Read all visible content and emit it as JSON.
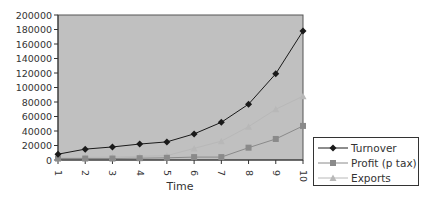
{
  "chart_data": {
    "type": "line",
    "title": "",
    "xlabel": "Time",
    "ylabel": "",
    "x": [
      1,
      2,
      3,
      4,
      5,
      6,
      7,
      8,
      9,
      10
    ],
    "ylim": [
      0,
      200000
    ],
    "yticks": [
      0,
      20000,
      40000,
      60000,
      80000,
      100000,
      120000,
      140000,
      160000,
      180000,
      200000
    ],
    "grid": false,
    "plot_background": "#c0c0c0",
    "legend_position": "right-bottom",
    "series": [
      {
        "name": "Turnover",
        "marker": "diamond",
        "color": "#1a1a1a",
        "values": [
          8000,
          15000,
          18000,
          22000,
          25000,
          36000,
          52000,
          77000,
          119000,
          178000
        ]
      },
      {
        "name": "Profit (p tax)",
        "marker": "square",
        "color": "#8a8a8a",
        "values": [
          2000,
          2000,
          2000,
          2500,
          3000,
          4000,
          4000,
          17000,
          29000,
          47000
        ]
      },
      {
        "name": "Exports",
        "marker": "triangle",
        "color": "#b8b8b8",
        "values": [
          3000,
          3500,
          4000,
          5000,
          6000,
          16000,
          26000,
          46000,
          70000,
          88000
        ]
      }
    ]
  },
  "labels": {
    "xlabel": "Time",
    "legend": [
      "Turnover",
      "Profit (p tax)",
      "Exports"
    ]
  }
}
